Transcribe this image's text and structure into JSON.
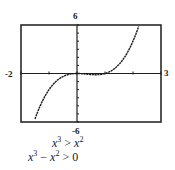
{
  "chart_data": {
    "type": "line",
    "title": "",
    "xlabel": "",
    "ylabel": "",
    "xlim": [
      -2,
      3
    ],
    "ylim": [
      -6,
      6
    ],
    "x_tick_labels": {
      "min": "-2",
      "max": "3"
    },
    "y_tick_labels": {
      "min": "-6",
      "max": "6"
    },
    "x_ticks": [
      -2,
      -1,
      0,
      1,
      2,
      3
    ],
    "y_ticks": [
      -6,
      -5,
      -4,
      -3,
      -2,
      -1,
      0,
      1,
      2,
      3,
      4,
      5,
      6
    ],
    "grid": false,
    "legend": null,
    "series": [
      {
        "name": "y = x^3 - x^2",
        "function": "x^3 - x^2",
        "x": [
          -1.5,
          -1.25,
          -1.0,
          -0.75,
          -0.5,
          -0.25,
          0,
          0.25,
          0.5,
          0.75,
          1.0,
          1.25,
          1.5,
          1.75,
          2.0,
          2.2
        ],
        "values": [
          -5.63,
          -3.52,
          -2.0,
          -0.98,
          -0.38,
          -0.08,
          0,
          -0.05,
          -0.13,
          -0.14,
          0,
          0.39,
          1.13,
          2.3,
          4.0,
          5.81
        ]
      }
    ],
    "annotations": [
      "x^3 > x^2",
      "x^3 - x^2 > 0"
    ]
  },
  "labels": {
    "y_max": "6",
    "y_min": "-6",
    "x_min": "-2",
    "x_max": "3"
  },
  "caption": {
    "line1": {
      "a_base": "x",
      "a_exp": "3",
      "op": " > ",
      "b_base": "x",
      "b_exp": "2"
    },
    "line2": {
      "a_base": "x",
      "a_exp": "3",
      "minus": " − ",
      "b_base": "x",
      "b_exp": "2",
      "op": " > ",
      "rhs": "0"
    }
  },
  "colors": {
    "axis": "#1f1f1f",
    "frame": "#2a2a2a",
    "curve": "#1a1a1a",
    "background": "#ffffff"
  }
}
